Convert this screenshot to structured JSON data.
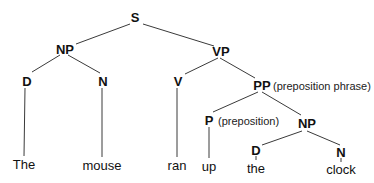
{
  "diagram": {
    "type": "syntax-tree",
    "nodes": {
      "s": {
        "label": "S"
      },
      "np1": {
        "label": "NP"
      },
      "vp": {
        "label": "VP"
      },
      "d1": {
        "label": "D"
      },
      "n1": {
        "label": "N"
      },
      "v": {
        "label": "V"
      },
      "pp": {
        "label": "PP",
        "note": "(preposition phrase)"
      },
      "p": {
        "label": "P",
        "note": "(preposition)"
      },
      "np2": {
        "label": "NP"
      },
      "d2": {
        "label": "D"
      },
      "n2": {
        "label": "N"
      }
    },
    "words": {
      "w1": "The",
      "w2": "mouse",
      "w3": "ran",
      "w4": "up",
      "w5": "the",
      "w6": "clock"
    },
    "edges": [
      [
        "S",
        "NP"
      ],
      [
        "S",
        "VP"
      ],
      [
        "NP",
        "D"
      ],
      [
        "NP",
        "N"
      ],
      [
        "VP",
        "V"
      ],
      [
        "VP",
        "PP"
      ],
      [
        "PP",
        "P"
      ],
      [
        "PP",
        "NP"
      ],
      [
        "NP",
        "D"
      ],
      [
        "NP",
        "N"
      ],
      [
        "D",
        "The"
      ],
      [
        "N",
        "mouse"
      ],
      [
        "V",
        "ran"
      ],
      [
        "P",
        "up"
      ],
      [
        "D",
        "the"
      ],
      [
        "N",
        "clock"
      ]
    ]
  }
}
